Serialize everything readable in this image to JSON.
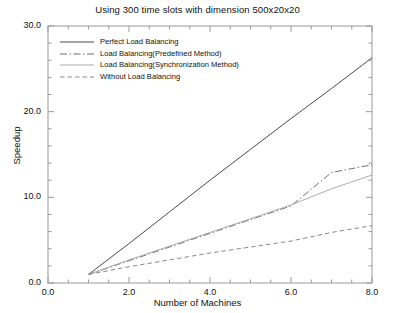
{
  "chart_data": {
    "type": "line",
    "title": "Using 300 time slots with dimension 500x20x20",
    "xlabel": "Number of Machines",
    "ylabel": "Speedup",
    "xlim": [
      0.0,
      8.0
    ],
    "ylim": [
      0.0,
      30.0
    ],
    "xticks": [
      "0.0",
      "2.0",
      "4.0",
      "6.0",
      "8.0"
    ],
    "xtick_values": [
      0.0,
      2.0,
      4.0,
      6.0,
      8.0
    ],
    "yticks": [
      "0.0",
      "10.0",
      "20.0",
      "30.0"
    ],
    "ytick_values": [
      0.0,
      10.0,
      20.0,
      30.0
    ],
    "grid": false,
    "legend_position": "upper-left",
    "x": [
      1,
      2,
      3,
      4,
      5,
      6,
      7,
      8
    ],
    "series": [
      {
        "name": "Perfect Load Balancing",
        "style": "solid",
        "color": "#4a4a4a",
        "values": [
          1.0,
          4.6,
          8.3,
          12.0,
          15.6,
          19.2,
          22.7,
          26.3
        ]
      },
      {
        "name": "Load Balancing(Predefined Method)",
        "style": "dash-dot",
        "color": "#707070",
        "values": [
          1.0,
          2.6,
          4.2,
          5.8,
          7.4,
          9.0,
          12.9,
          13.8
        ]
      },
      {
        "name": "Load Balancing(Synchronization Method)",
        "style": "solid-light",
        "color": "#adadad",
        "values": [
          1.0,
          2.7,
          4.3,
          5.9,
          7.5,
          9.1,
          11.0,
          12.6
        ]
      },
      {
        "name": "Without Load Balancing",
        "style": "dashed",
        "color": "#8a8a8a",
        "values": [
          1.0,
          1.9,
          2.7,
          3.5,
          4.2,
          4.9,
          5.9,
          6.7
        ]
      }
    ]
  }
}
